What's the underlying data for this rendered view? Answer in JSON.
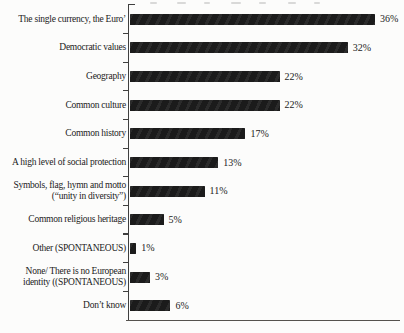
{
  "chart_data": {
    "type": "bar",
    "orientation": "horizontal",
    "title": "",
    "xlabel": "",
    "ylabel": "",
    "unit": "%",
    "xlim": [
      0,
      40
    ],
    "grid": false,
    "legend": "none",
    "bar_color": "#1b1b1b",
    "axis_color": "#3f3f3f",
    "text_color": "#222222",
    "background_color": "#fcfcfb",
    "categories": [
      "The single currency, the Euro’",
      "Democratic values",
      "Geography",
      "Common culture",
      "Common history",
      "A high level of social protection",
      "Symbols, flag, hymn and motto\n(“unity in diversity”)",
      "Common religious heritage",
      "Other (SPONTANEOUS)",
      "None/ There is no European\nidentity ((SPONTANEOUS)",
      "Don’t know"
    ],
    "values": [
      36,
      32,
      22,
      22,
      17,
      13,
      11,
      5,
      1,
      3,
      6
    ],
    "value_labels": [
      "36%",
      "32%",
      "22%",
      "22%",
      "17%",
      "13%",
      "11%",
      "5%",
      "1%",
      "3%",
      "6%"
    ]
  }
}
